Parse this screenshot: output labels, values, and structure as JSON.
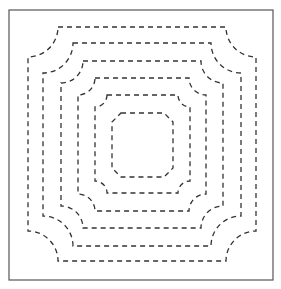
{
  "diagram": {
    "type": "concentric-dashed-contours",
    "frame": {
      "x": 9,
      "y": 10,
      "width": 264,
      "height": 270,
      "stroke": "#555555"
    },
    "stroke_color": "#333333",
    "dash": "5,4",
    "contours": [
      {
        "x1": 28,
        "y1": 27,
        "x2": 256,
        "y2": 261,
        "r": 30,
        "corner": "concave"
      },
      {
        "x1": 43,
        "y1": 43,
        "x2": 241,
        "y2": 246,
        "r": 30,
        "corner": "concave"
      },
      {
        "x1": 61,
        "y1": 61,
        "x2": 223,
        "y2": 228,
        "r": 22,
        "corner": "concave"
      },
      {
        "x1": 78,
        "y1": 78,
        "x2": 206,
        "y2": 211,
        "r": 17,
        "corner": "concave"
      },
      {
        "x1": 95,
        "y1": 95,
        "x2": 190,
        "y2": 193,
        "r": 12,
        "corner": "concave"
      },
      {
        "x1": 112,
        "y1": 113,
        "x2": 173,
        "y2": 177,
        "r": 9,
        "corner": "chamfer"
      }
    ]
  }
}
